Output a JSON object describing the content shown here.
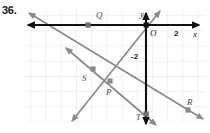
{
  "problem": {
    "number": "36."
  },
  "figure": {
    "type": "coordinate-plane-diagram",
    "grid": {
      "visible": true,
      "color": "#d7e2ef",
      "spacing": 15.2,
      "left": 24,
      "top": 10,
      "right": 206,
      "bottom": 122
    },
    "axes": {
      "color": "#111111",
      "x_axis_label": "x",
      "y_axis_label": "y",
      "origin_label": "O",
      "x_axis_y": 25,
      "y_axis_x": 146,
      "ticks": [
        {
          "label": "2",
          "axis": "x",
          "x": 176,
          "y": 33
        },
        {
          "label": "-2",
          "axis": "y",
          "x": 132,
          "y": 57
        }
      ]
    },
    "lines": [
      {
        "name": "line-through-Q-and-R",
        "color": "#8a8a8a",
        "x1": 29,
        "y1": 13,
        "x2": 203,
        "y2": 119,
        "arrows": "both"
      },
      {
        "name": "line-through-S-and-P",
        "color": "#8a8a8a",
        "x1": 66,
        "y1": 48,
        "x2": 156,
        "y2": 125,
        "arrows": "both"
      },
      {
        "name": "line-through-P-and-T",
        "color": "#8a8a8a",
        "x1": 72,
        "y1": 121,
        "x2": 160,
        "y2": 11,
        "arrows": "both"
      }
    ],
    "points": [
      {
        "name": "point-Q",
        "label": "Q",
        "x": 88,
        "y": 25,
        "label_x": 96,
        "label_y": 11
      },
      {
        "name": "point-S",
        "label": "S",
        "x": 93,
        "y": 69,
        "label_x": 82,
        "label_y": 74
      },
      {
        "name": "point-P",
        "label": "P",
        "x": 110,
        "y": 81,
        "label_x": 106,
        "label_y": 88
      },
      {
        "name": "point-R",
        "label": "R",
        "x": 188,
        "y": 110,
        "label_x": 187,
        "label_y": 98
      },
      {
        "name": "point-T",
        "label": "T",
        "x": 146,
        "y": 114,
        "label_x": 136,
        "label_y": 113
      }
    ]
  }
}
